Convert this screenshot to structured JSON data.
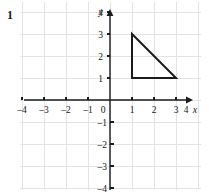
{
  "figure": {
    "problem_number": "1",
    "x_axis_label": "x",
    "y_axis_label": "y",
    "origin_label": "0"
  },
  "chart_data": {
    "type": "scatter",
    "title": "",
    "subtitle": "",
    "xlabel": "x",
    "ylabel": "y",
    "xlim": [
      -4.6,
      4.6
    ],
    "ylim": [
      -4.6,
      4.6
    ],
    "grid": true,
    "legend": "none",
    "x_ticks": [
      -4,
      -3,
      -2,
      -1,
      0,
      1,
      2,
      3,
      4
    ],
    "y_ticks": [
      4,
      3,
      2,
      1,
      0,
      -1,
      -2,
      -3,
      -4
    ],
    "x_tick_labels": [
      "–4",
      "–3",
      "–2",
      "–1",
      "0",
      "1",
      "2",
      "3",
      "4"
    ],
    "y_tick_labels": [
      "4",
      "3",
      "2",
      "1",
      "0",
      "–1",
      "–2",
      "–3",
      "–4"
    ],
    "annotations": [],
    "shapes": [
      {
        "name": "right-triangle",
        "type": "polygon",
        "closed": true,
        "vertices": [
          {
            "x": 1,
            "y": 3
          },
          {
            "x": 1,
            "y": 1
          },
          {
            "x": 3,
            "y": 1
          }
        ],
        "stroke": "#1b1b1b",
        "fill": "none"
      }
    ]
  },
  "colors": {
    "grid_line": "#e3e3e6",
    "axis_line": "#1b1b1b",
    "text": "#17171a",
    "shape_stroke": "#1b1b1b",
    "background": "#ffffff"
  },
  "geometry": {
    "origin_px": {
      "x": 110,
      "y": 100
    },
    "unit_px": 22,
    "grid_bounds_px": {
      "left": 20,
      "top": 2,
      "right": 201,
      "bottom": 190
    }
  }
}
